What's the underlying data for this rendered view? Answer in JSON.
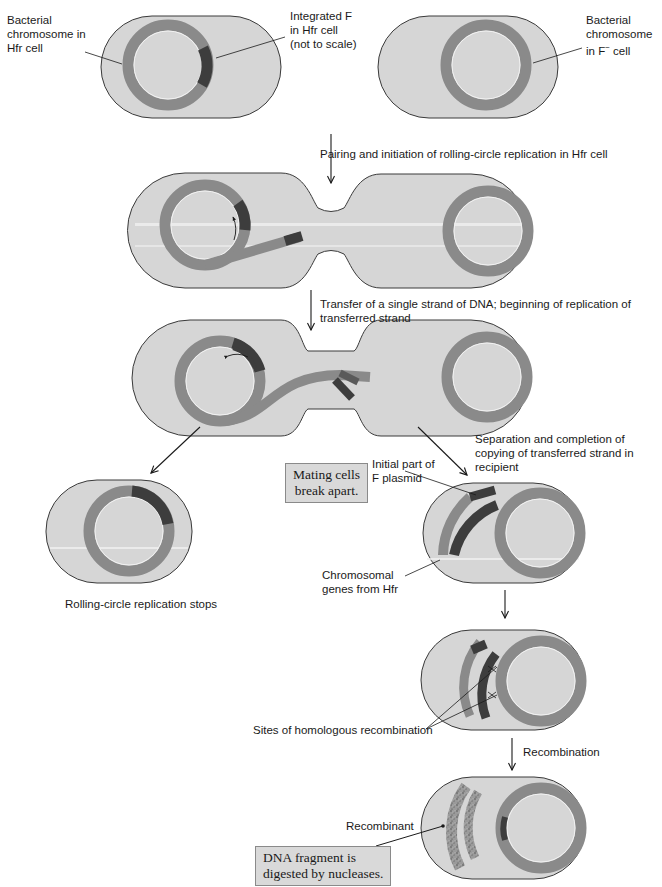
{
  "figure": {
    "colors": {
      "cell_fill": "#d6d6d6",
      "cell_stroke": "#3a3a3a",
      "chromosome": "#8a8a8a",
      "f_factor": "#3d3d3d",
      "inner_line": "#f2f2f2",
      "note_fill": "#d9d9d9"
    },
    "labels": {
      "hfr_chromosome": "Bacterial\nchromosome in\nHfr cell",
      "integrated_f": "Integrated F\nin Hfr cell\n(not to scale)",
      "fminus_chromosome_line1": "Bacterial\nchromosome",
      "fminus_chromosome_line2_prefix": "in F",
      "fminus_superscript": "−",
      "fminus_chromosome_line2_suffix": " cell",
      "step1": "Pairing and initiation of rolling-circle replication in Hfr cell",
      "step2": "Transfer of a single strand of DNA; beginning of replication of\ntransferred strand",
      "step3": "Separation and completion of\ncopying of transferred strand in\nrecipient",
      "initial_f_plasmid": "Initial part of\nF plasmid",
      "chromosomal_genes": "Chromosomal\ngenes from Hfr",
      "rolling_stops": "Rolling-circle replication stops",
      "homologous_sites": "Sites of homologous recombination",
      "recombination": "Recombination",
      "recombinant": "Recombinant"
    },
    "notes": {
      "mating_cells": "Mating cells\nbreak apart.",
      "dna_fragment": "DNA fragment is\ndigested by nucleases."
    }
  }
}
